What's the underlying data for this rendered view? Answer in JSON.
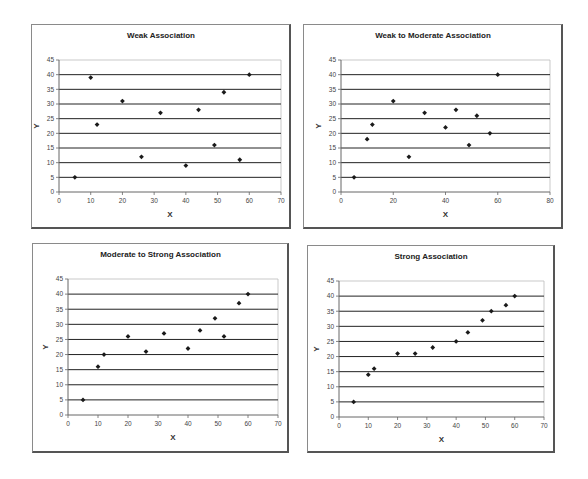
{
  "chart_data": [
    {
      "type": "scatter",
      "title": "Weak Association",
      "xlabel": "X",
      "ylabel": "Y",
      "xlim": [
        0,
        70
      ],
      "ylim": [
        0,
        45
      ],
      "xticks": [
        0,
        10,
        20,
        30,
        40,
        50,
        60,
        70
      ],
      "yticks": [
        0,
        5,
        10,
        15,
        20,
        25,
        30,
        35,
        40,
        45
      ],
      "grid": "horizontal",
      "x": [
        5,
        10,
        12,
        20,
        26,
        32,
        40,
        44,
        49,
        52,
        57,
        60
      ],
      "y": [
        5,
        39,
        23,
        31,
        12,
        27,
        9,
        28,
        16,
        34,
        11,
        40
      ],
      "layout": {
        "frame": [
          31,
          24,
          260,
          205
        ],
        "plot": [
          59,
          60,
          281,
          192
        ]
      }
    },
    {
      "type": "scatter",
      "title": "Weak to Moderate Association",
      "xlabel": "X",
      "ylabel": "Y",
      "xlim": [
        0,
        80
      ],
      "ylim": [
        0,
        45
      ],
      "xticks": [
        0,
        20,
        40,
        60,
        80
      ],
      "yticks": [
        0,
        5,
        10,
        15,
        20,
        25,
        30,
        35,
        40,
        45
      ],
      "grid": "horizontal",
      "x": [
        5,
        10,
        12,
        20,
        26,
        32,
        40,
        44,
        49,
        52,
        57,
        60
      ],
      "y": [
        5,
        18,
        23,
        31,
        12,
        27,
        22,
        28,
        16,
        26,
        20,
        40
      ],
      "layout": {
        "frame": [
          303,
          24,
          260,
          205
        ],
        "plot": [
          341,
          60,
          550,
          192
        ]
      }
    },
    {
      "type": "scatter",
      "title": "Moderate to Strong Association",
      "xlabel": "X",
      "ylabel": "Y",
      "xlim": [
        0,
        70
      ],
      "ylim": [
        0,
        45
      ],
      "xticks": [
        0,
        10,
        20,
        30,
        40,
        50,
        60,
        70
      ],
      "yticks": [
        0,
        5,
        10,
        15,
        20,
        25,
        30,
        35,
        40,
        45
      ],
      "grid": "horizontal",
      "x": [
        5,
        10,
        12,
        20,
        26,
        32,
        40,
        44,
        49,
        52,
        57,
        60
      ],
      "y": [
        5,
        16,
        20,
        26,
        21,
        27,
        22,
        28,
        32,
        26,
        37,
        40
      ],
      "layout": {
        "frame": [
          32,
          243,
          257,
          210
        ],
        "plot": [
          68,
          279,
          278,
          415
        ]
      }
    },
    {
      "type": "scatter",
      "title": "Strong Association",
      "xlabel": "X",
      "ylabel": "Y",
      "xlim": [
        0,
        70
      ],
      "ylim": [
        0,
        45
      ],
      "xticks": [
        0,
        10,
        20,
        30,
        40,
        50,
        60,
        70
      ],
      "yticks": [
        0,
        5,
        10,
        15,
        20,
        25,
        30,
        35,
        40,
        45
      ],
      "grid": "horizontal",
      "x": [
        5,
        10,
        12,
        20,
        26,
        32,
        40,
        44,
        49,
        52,
        57,
        60
      ],
      "y": [
        5,
        14,
        16,
        21,
        21,
        23,
        25,
        28,
        32,
        35,
        37,
        40
      ],
      "layout": {
        "frame": [
          307,
          245,
          248,
          208
        ],
        "plot": [
          339,
          281,
          544,
          417
        ]
      }
    }
  ],
  "colors": {
    "marker": "#1a1a1a",
    "grid": "#222222",
    "axis": "#666666",
    "frame": "#777777"
  }
}
